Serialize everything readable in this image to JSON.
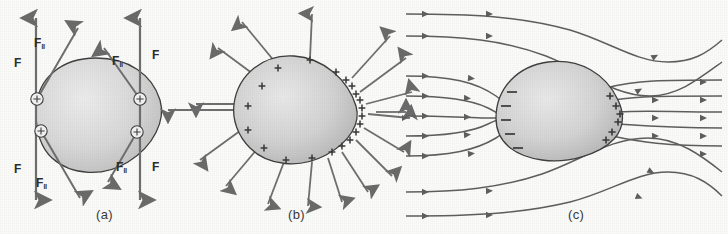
{
  "figure": {
    "background_color": "#fbfbf9",
    "ink_color": "#5a5a5a",
    "outline_color": "#3d3d3d",
    "body_fill_light": "#e8e8e8",
    "body_fill_dark": "#b4b4b4"
  },
  "panels": [
    {
      "id": "a",
      "caption": "(a)",
      "description": "Conducting body with four circled surface charges and vertical field lines; force F and tangential component F-parallel at each charge",
      "force_labels": [
        {
          "id": "f-top-left",
          "text": "F",
          "sub": "",
          "x": 14,
          "y": 56
        },
        {
          "id": "f-par-top-left",
          "text": "F",
          "sub": "‖",
          "x": 34,
          "y": 36
        },
        {
          "id": "f-par-top-right",
          "text": "F",
          "sub": "‖",
          "x": 112,
          "y": 54
        },
        {
          "id": "f-top-right",
          "text": "F",
          "sub": "",
          "x": 152,
          "y": 48
        },
        {
          "id": "f-bottom-left",
          "text": "F",
          "sub": "",
          "x": 14,
          "y": 162
        },
        {
          "id": "f-par-bottom-left",
          "text": "F",
          "sub": "‖",
          "x": 36,
          "y": 176
        },
        {
          "id": "f-par-bottom-right",
          "text": "F",
          "sub": "‖",
          "x": 116,
          "y": 160
        },
        {
          "id": "f-bottom-right",
          "text": "F",
          "sub": "",
          "x": 152,
          "y": 160
        }
      ],
      "charges": [
        {
          "id": "charge-upper-left",
          "sign": "+",
          "x": 37,
          "y": 99
        },
        {
          "id": "charge-lower-left",
          "sign": "+",
          "x": 41,
          "y": 131
        },
        {
          "id": "charge-upper-right",
          "sign": "+",
          "x": 140,
          "y": 99
        },
        {
          "id": "charge-lower-right",
          "sign": "+",
          "x": 137,
          "y": 132
        }
      ],
      "vertical_field_lines": [
        {
          "id": "field-line-left",
          "x": 36
        },
        {
          "id": "field-line-right",
          "x": 140
        }
      ]
    },
    {
      "id": "b",
      "caption": "(b)",
      "description": "Isolated charged body: field arrows radiate outward, surface charge density greatest at the pointed right end",
      "surface_charge_sign": "+",
      "surface_charge_count": 22,
      "radial_arrow_count": 18
    },
    {
      "id": "c",
      "caption": "(c)",
      "description": "Body in a uniform external field directed left to right; induced negative charge on the blunt left face and positive charge concentrated at the pointed right tip",
      "negative_sign": "−",
      "positive_sign": "+",
      "negative_count": 5,
      "positive_count": 6,
      "field_direction": "left-to-right",
      "field_line_count": 9
    }
  ]
}
